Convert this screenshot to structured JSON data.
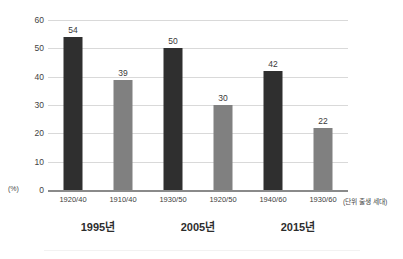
{
  "chart_data": {
    "type": "bar",
    "title": "",
    "subtitle": "",
    "xlabel": "",
    "ylabel": "(%)",
    "ylim": [
      0,
      60
    ],
    "ytick_step": 10,
    "yticks": [
      60,
      50,
      40,
      30,
      20,
      10,
      0
    ],
    "grid": true,
    "legend": "none",
    "unit_note": "(단위 출생 세대)",
    "categories": [
      "1920/40",
      "1910/40",
      "1930/50",
      "1920/50",
      "1940/60",
      "1930/60"
    ],
    "values": [
      54,
      39,
      50,
      30,
      42,
      22
    ],
    "bar_colors": [
      "#2f2f2f",
      "#808080",
      "#2f2f2f",
      "#808080",
      "#2f2f2f",
      "#808080"
    ],
    "bars": [
      {
        "category": "1920/40",
        "value": 54,
        "style": "dark",
        "group": "1995년"
      },
      {
        "category": "1910/40",
        "value": 39,
        "style": "light",
        "group": "1995년"
      },
      {
        "category": "1930/50",
        "value": 50,
        "style": "dark",
        "group": "2005년"
      },
      {
        "category": "1920/50",
        "value": 30,
        "style": "light",
        "group": "2005년"
      },
      {
        "category": "1940/60",
        "value": 42,
        "style": "dark",
        "group": "2015년"
      },
      {
        "category": "1930/60",
        "value": 22,
        "style": "light",
        "group": "2015년"
      }
    ],
    "groups": [
      "1995년",
      "2005년",
      "2015년"
    ],
    "colors": {
      "dark_bar": "#2f2f2f",
      "light_bar": "#808080",
      "gridline": "#d9d9d9",
      "axis": "#8a8a8a",
      "text": "#3a3a3a",
      "background": "#ffffff"
    }
  }
}
